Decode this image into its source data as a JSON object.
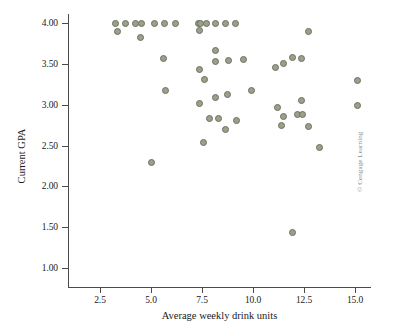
{
  "figure": {
    "credit": "© Cengage Learning",
    "point_color": "#9aa08a",
    "point_border_color": "#6b7060",
    "axis_color": "#4a4a4a"
  },
  "chart_data": {
    "type": "scatter",
    "title": "",
    "xlabel": "Average weekly drink units",
    "ylabel": "Current GPA",
    "xlim": [
      1.1,
      15.9
    ],
    "ylim": [
      0.77,
      4.16
    ],
    "xticks": [
      2.5,
      5.0,
      7.5,
      10.0,
      12.5,
      15.0
    ],
    "xtick_labels": [
      "2.5",
      "5.0",
      "7.5",
      "10.0",
      "12.5",
      "15.0"
    ],
    "yticks": [
      1.0,
      1.5,
      2.0,
      2.5,
      3.0,
      3.5,
      4.0
    ],
    "ytick_labels": [
      "1.00",
      "1.50",
      "2.00",
      "2.50",
      "3.00",
      "3.50",
      "4.00"
    ],
    "grid": false,
    "legend": null,
    "series": [
      {
        "name": "students",
        "marker": "circle",
        "points": [
          [
            3.36,
            3.89
          ],
          [
            3.24,
            4.0
          ],
          [
            3.73,
            4.0
          ],
          [
            4.26,
            4.0
          ],
          [
            4.51,
            4.0
          ],
          [
            4.5,
            3.82
          ],
          [
            5.15,
            4.0
          ],
          [
            5.64,
            4.0
          ],
          [
            5.63,
            3.57
          ],
          [
            6.21,
            4.0
          ],
          [
            5.01,
            2.29
          ],
          [
            5.71,
            3.17
          ],
          [
            7.35,
            4.0
          ],
          [
            7.45,
            4.0
          ],
          [
            7.4,
            3.91
          ],
          [
            7.74,
            4.0
          ],
          [
            8.16,
            4.0
          ],
          [
            8.65,
            4.0
          ],
          [
            9.14,
            4.0
          ],
          [
            7.4,
            3.43
          ],
          [
            7.64,
            3.31
          ],
          [
            8.16,
            3.66
          ],
          [
            8.14,
            3.53
          ],
          [
            8.78,
            3.54
          ],
          [
            9.51,
            3.55
          ],
          [
            7.4,
            3.02
          ],
          [
            8.16,
            3.09
          ],
          [
            8.73,
            3.12
          ],
          [
            9.93,
            3.17
          ],
          [
            7.85,
            2.83
          ],
          [
            8.29,
            2.83
          ],
          [
            9.2,
            2.81
          ],
          [
            8.65,
            2.69
          ],
          [
            7.57,
            2.54
          ],
          [
            11.1,
            3.45
          ],
          [
            11.5,
            3.51
          ],
          [
            11.92,
            3.58
          ],
          [
            12.38,
            3.56
          ],
          [
            12.72,
            3.89
          ],
          [
            11.2,
            2.97
          ],
          [
            11.5,
            2.85
          ],
          [
            11.4,
            2.75
          ],
          [
            12.18,
            2.88
          ],
          [
            12.42,
            2.88
          ],
          [
            12.4,
            3.05
          ],
          [
            12.72,
            2.73
          ],
          [
            13.25,
            2.47
          ],
          [
            11.92,
            1.43
          ],
          [
            15.1,
            3.3
          ],
          [
            15.1,
            2.99
          ]
        ]
      }
    ]
  }
}
